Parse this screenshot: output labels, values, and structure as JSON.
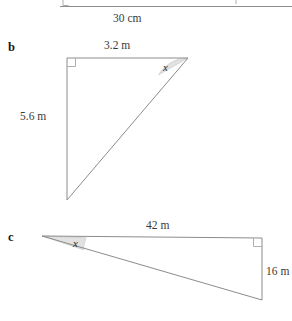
{
  "page": {
    "background_color": "#ffffff",
    "line_color": "#8c8c8c",
    "angle_fill_color": "#e2e2e2",
    "text_color": "#3a3a3a"
  },
  "figures": [
    {
      "id": "figure-a",
      "letter": "",
      "note": "partially visible figure cropped at the top edge of the screenshot",
      "labels": [
        {
          "name": "base-length-label",
          "text": "30 cm"
        }
      ]
    },
    {
      "id": "figure-b",
      "letter": "b",
      "shape": "right-triangle",
      "right_angle_vertex": "top-left",
      "angle_marker": {
        "name": "angle-x",
        "text": "x",
        "vertex": "top-right"
      },
      "labels": [
        {
          "name": "top-side-label",
          "text": "3.2 m"
        },
        {
          "name": "left-side-label",
          "text": "5.6 m"
        }
      ]
    },
    {
      "id": "figure-c",
      "letter": "c",
      "shape": "right-triangle",
      "right_angle_vertex": "top-right",
      "angle_marker": {
        "name": "angle-x",
        "text": "x",
        "vertex": "left"
      },
      "labels": [
        {
          "name": "top-side-label",
          "text": "42 m"
        },
        {
          "name": "right-side-label",
          "text": "16 m"
        }
      ]
    }
  ]
}
